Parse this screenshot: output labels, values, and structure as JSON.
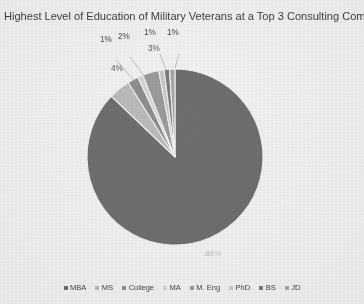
{
  "chart_data": {
    "type": "pie",
    "title": "Highest Level of Education of Military Veterans at a Top 3 Consulting Company",
    "categories": [
      "MBA",
      "MS",
      "College",
      "MA",
      "M. Eng",
      "PhD",
      "BS",
      "JD"
    ],
    "values": [
      88,
      4,
      2,
      1,
      3,
      1,
      1,
      1
    ],
    "data_labels": [
      "88%",
      "4%",
      "2%",
      "1%",
      "3%",
      "1%",
      "1%",
      "1%"
    ],
    "legend_position": "bottom",
    "grid": false,
    "start_angle_deg": 0,
    "direction": "clockwise",
    "colors": [
      "#6f6f6f",
      "#bcbcbc",
      "#8f8f8f",
      "#d6d6d6",
      "#9c9c9c",
      "#c9c9c9",
      "#7c7c7c",
      "#a8a8a8"
    ]
  },
  "title": "Highest Level of Education of Military Veterans at a Top 3 Consulting Company",
  "labels": {
    "callout_mba": "1%",
    "callout_ms": "2%",
    "callout_phd": "1%",
    "callout_bs": "1%",
    "inline_college": "4%",
    "inline_ma": "3%",
    "inline_main": "88%"
  },
  "legend": {
    "items": [
      {
        "label": "MBA",
        "color": "#6f6f6f"
      },
      {
        "label": "MS",
        "color": "#bcbcbc"
      },
      {
        "label": "College",
        "color": "#8f8f8f"
      },
      {
        "label": "MA",
        "color": "#d6d6d6"
      },
      {
        "label": "M. Eng",
        "color": "#9c9c9c"
      },
      {
        "label": "PhD",
        "color": "#c9c9c9"
      },
      {
        "label": "BS",
        "color": "#7c7c7c"
      },
      {
        "label": "JD",
        "color": "#a8a8a8"
      }
    ]
  }
}
